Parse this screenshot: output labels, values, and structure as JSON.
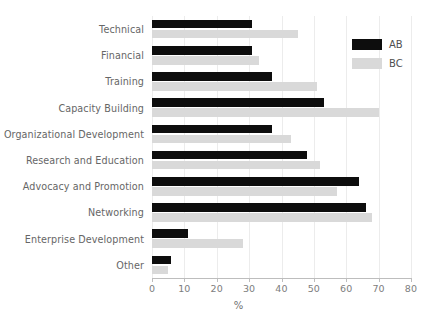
{
  "chart_data": {
    "type": "bar",
    "orientation": "horizontal",
    "title": "",
    "subtitle": "",
    "xlabel": "%",
    "ylabel": "",
    "xlim": [
      0,
      80
    ],
    "xticks": [
      0,
      10,
      20,
      30,
      40,
      50,
      60,
      70,
      80
    ],
    "xtick_labels": [
      "0",
      "10",
      "20",
      "30",
      "40",
      "50",
      "60",
      "70",
      "80"
    ],
    "grid": true,
    "grid_axis": "x",
    "legend_position": "top-right",
    "categories": [
      "Technical",
      "Financial",
      "Training",
      "Capacity Building",
      "Organizational Development",
      "Research and Education",
      "Advocacy and Promotion",
      "Networking",
      "Enterprise Development",
      "Other"
    ],
    "series": [
      {
        "name": "AB",
        "color": "#0d0d0d",
        "values": [
          31,
          31,
          37,
          53,
          37,
          48,
          64,
          66,
          11,
          6
        ]
      },
      {
        "name": "BC",
        "color": "#d9d9d9",
        "values": [
          45,
          33,
          51,
          70,
          43,
          52,
          57,
          68,
          28,
          5
        ]
      }
    ]
  },
  "legend": {
    "entries": [
      {
        "label": "AB",
        "color": "#0d0d0d"
      },
      {
        "label": "BC",
        "color": "#d9d9d9"
      }
    ]
  },
  "axis": {
    "x_title": "%"
  }
}
